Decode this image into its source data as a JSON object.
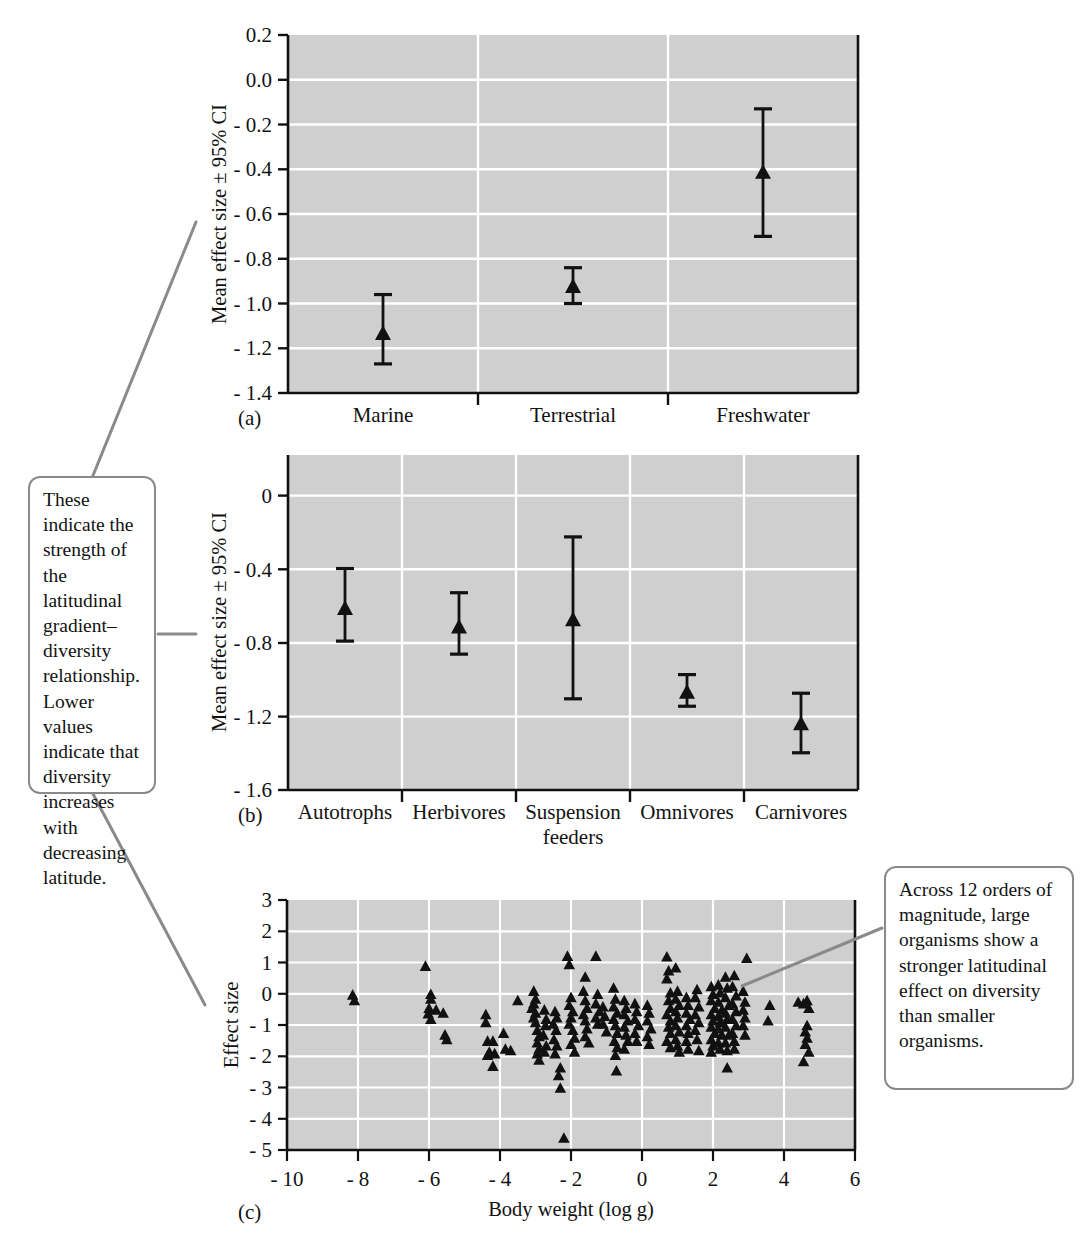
{
  "figure": {
    "panels": [
      {
        "id": "a",
        "letter": "(a)",
        "ylabel": "Mean effect size ± 95% CI",
        "xlabel": ""
      },
      {
        "id": "b",
        "letter": "(b)",
        "ylabel": "Mean effect size ± 95% CI",
        "xlabel": ""
      },
      {
        "id": "c",
        "letter": "(c)",
        "ylabel": "Effect size",
        "xlabel": "Body weight (log g)"
      }
    ],
    "annotations": [
      {
        "id": "callout-left",
        "text": "These indicate the strength of the latitudinal gradient–diversity relationship. Lower values indicate that diversity increases with decreasing latitude.",
        "lines": [
          "These",
          "indicate the",
          "strength of",
          "the latitudinal",
          "gradient–",
          "diversity",
          "relationship.",
          "Lower values",
          "indicate that",
          "diversity",
          "increases with",
          "decreasing",
          "latitude."
        ],
        "points_to": [
          "panel-a",
          "panel-b",
          "panel-c"
        ]
      },
      {
        "id": "callout-right",
        "text": "Across 12 orders of magnitude, large organisms show a stronger latitudinal effect on diversity than smaller organisms.",
        "lines": [
          "Across 12 orders",
          "of magnitude,",
          "large organisms",
          "show a stronger",
          "latitudinal effect",
          "on diversity",
          "than smaller",
          "organisms."
        ],
        "points_to": [
          "panel-c"
        ]
      }
    ],
    "colors": {
      "plot_background": "#cfcfcf",
      "gridline": "#ffffff",
      "marker": "#111111",
      "axis": "#111111",
      "callout_border": "#8a8a8a",
      "leader_line": "#8a8a8a",
      "page_background": "#ffffff"
    }
  },
  "chart_data": [
    {
      "type": "scatter",
      "id": "panel-a",
      "title": "",
      "xlabel": "",
      "ylabel": "Mean effect size ± 95% CI",
      "ylim": [
        -1.4,
        0.2
      ],
      "yticks": [
        "0.2",
        "0.0",
        "- 0.2",
        "- 0.4",
        "- 0.6",
        "- 0.8",
        "- 1.0",
        "- 1.2",
        "- 1.4"
      ],
      "ytick_values": [
        0.2,
        0.0,
        -0.2,
        -0.4,
        -0.6,
        -0.8,
        -1.0,
        -1.2,
        -1.4
      ],
      "grid": true,
      "legend": "none",
      "categories": [
        "Marine",
        "Terrestrial",
        "Freshwater"
      ],
      "values": [
        -1.13,
        -0.92,
        -0.41
      ],
      "ci_low": [
        -1.27,
        -1.0,
        -0.7
      ],
      "ci_high": [
        -0.96,
        -0.84,
        -0.13
      ],
      "marker": "triangle"
    },
    {
      "type": "scatter",
      "id": "panel-b",
      "title": "",
      "xlabel": "",
      "ylabel": "Mean effect size ± 95% CI",
      "ylim": [
        -1.6,
        0.2
      ],
      "yticks": [
        "0",
        "- 0.4",
        "- 0.8",
        "- 1.2",
        "- 1.6"
      ],
      "ytick_values": [
        0.0,
        -0.4,
        -0.8,
        -1.2,
        -1.6
      ],
      "grid": true,
      "legend": "none",
      "categories": [
        "Autotrophs",
        "Herbivores",
        "Suspension feeders",
        "Omnivores",
        "Carnivores"
      ],
      "category_lines": [
        [
          "Autotrophs"
        ],
        [
          "Herbivores"
        ],
        [
          "Suspension",
          "feeders"
        ],
        [
          "Omnivores"
        ],
        [
          "Carnivores"
        ]
      ],
      "values": [
        -0.62,
        -0.72,
        -0.68,
        -1.07,
        -1.24
      ],
      "ci_low": [
        -0.8,
        -0.87,
        -1.11,
        -1.15,
        -1.4
      ],
      "ci_high": [
        -0.41,
        -0.54,
        -0.24,
        -0.98,
        -1.08
      ],
      "marker": "triangle"
    },
    {
      "type": "scatter",
      "id": "panel-c",
      "title": "",
      "xlabel": "Body weight (log g)",
      "ylabel": "Effect size",
      "xlim": [
        -10,
        6
      ],
      "ylim": [
        -5,
        3
      ],
      "xticks": [
        "- 10",
        "- 8",
        "- 6",
        "- 4",
        "- 2",
        "0",
        "2",
        "4",
        "6"
      ],
      "xtick_values": [
        -10,
        -8,
        -6,
        -4,
        -2,
        0,
        2,
        4,
        6
      ],
      "yticks": [
        "3",
        "2",
        "1",
        "0",
        "- 1",
        "- 2",
        "- 3",
        "- 4",
        "- 5"
      ],
      "ytick_values": [
        3,
        2,
        1,
        0,
        -1,
        -2,
        -3,
        -4,
        -5
      ],
      "grid": true,
      "legend": "none",
      "marker": "triangle",
      "points": [
        [
          -8.15,
          -0.02
        ],
        [
          -8.1,
          -0.2
        ],
        [
          -6.1,
          0.9
        ],
        [
          -5.95,
          0.0
        ],
        [
          -5.95,
          -0.15
        ],
        [
          -6.0,
          -0.45
        ],
        [
          -5.8,
          -0.5
        ],
        [
          -6.02,
          -0.62
        ],
        [
          -5.95,
          -0.8
        ],
        [
          -5.6,
          -0.6
        ],
        [
          -5.55,
          -1.3
        ],
        [
          -5.5,
          -1.45
        ],
        [
          -4.4,
          -0.65
        ],
        [
          -4.4,
          -0.9
        ],
        [
          -4.35,
          -1.5
        ],
        [
          -4.2,
          -1.5
        ],
        [
          -4.3,
          -1.85
        ],
        [
          -4.15,
          -1.9
        ],
        [
          -4.35,
          -1.95
        ],
        [
          -4.2,
          -2.3
        ],
        [
          -3.9,
          -1.25
        ],
        [
          -3.85,
          -1.75
        ],
        [
          -3.7,
          -1.8
        ],
        [
          -3.5,
          -0.2
        ],
        [
          -3.05,
          0.1
        ],
        [
          -3.0,
          -0.15
        ],
        [
          -3.05,
          -0.3
        ],
        [
          -3.1,
          -0.45
        ],
        [
          -3.0,
          -0.6
        ],
        [
          -3.05,
          -0.75
        ],
        [
          -3.0,
          -0.9
        ],
        [
          -2.95,
          -1.15
        ],
        [
          -2.9,
          -1.35
        ],
        [
          -2.95,
          -1.55
        ],
        [
          -2.9,
          -1.75
        ],
        [
          -2.95,
          -1.9
        ],
        [
          -2.9,
          -2.1
        ],
        [
          -2.75,
          -0.5
        ],
        [
          -2.7,
          -0.8
        ],
        [
          -2.72,
          -1.0
        ],
        [
          -2.78,
          -1.3
        ],
        [
          -2.7,
          -1.65
        ],
        [
          -2.75,
          -1.85
        ],
        [
          -2.45,
          -0.55
        ],
        [
          -2.4,
          -0.75
        ],
        [
          -2.5,
          -0.95
        ],
        [
          -2.42,
          -1.15
        ],
        [
          -2.48,
          -1.45
        ],
        [
          -2.4,
          -1.65
        ],
        [
          -2.45,
          -1.9
        ],
        [
          -2.3,
          -2.35
        ],
        [
          -2.35,
          -2.6
        ],
        [
          -2.3,
          -3.0
        ],
        [
          -2.2,
          -4.6
        ],
        [
          -2.1,
          1.22
        ],
        [
          -2.05,
          0.95
        ],
        [
          -2.0,
          -0.1
        ],
        [
          -2.05,
          -0.35
        ],
        [
          -1.95,
          -0.55
        ],
        [
          -2.0,
          -0.75
        ],
        [
          -2.05,
          -0.95
        ],
        [
          -1.95,
          -1.15
        ],
        [
          -1.9,
          -1.4
        ],
        [
          -2.0,
          -1.6
        ],
        [
          -1.9,
          -1.85
        ],
        [
          -1.6,
          0.55
        ],
        [
          -1.65,
          0.1
        ],
        [
          -1.6,
          -0.2
        ],
        [
          -1.55,
          -0.45
        ],
        [
          -1.65,
          -0.65
        ],
        [
          -1.6,
          -0.85
        ],
        [
          -1.55,
          -1.1
        ],
        [
          -1.6,
          -1.35
        ],
        [
          -1.5,
          -1.55
        ],
        [
          -1.3,
          1.22
        ],
        [
          -1.25,
          0.0
        ],
        [
          -1.3,
          -0.3
        ],
        [
          -1.2,
          -0.55
        ],
        [
          -1.3,
          -0.75
        ],
        [
          -1.25,
          -0.95
        ],
        [
          -1.1,
          -0.4
        ],
        [
          -1.05,
          -0.7
        ],
        [
          -1.1,
          -0.95
        ],
        [
          -1.0,
          -1.2
        ],
        [
          -0.8,
          0.2
        ],
        [
          -0.75,
          -0.15
        ],
        [
          -0.8,
          -0.4
        ],
        [
          -0.7,
          -0.6
        ],
        [
          -0.8,
          -0.8
        ],
        [
          -0.75,
          -1.0
        ],
        [
          -0.7,
          -1.25
        ],
        [
          -0.78,
          -1.5
        ],
        [
          -0.7,
          -1.7
        ],
        [
          -0.75,
          -1.95
        ],
        [
          -0.72,
          -2.45
        ],
        [
          -0.5,
          -0.2
        ],
        [
          -0.45,
          -0.45
        ],
        [
          -0.5,
          -0.65
        ],
        [
          -0.4,
          -0.85
        ],
        [
          -0.5,
          -1.05
        ],
        [
          -0.45,
          -1.3
        ],
        [
          -0.4,
          -1.5
        ],
        [
          -0.5,
          -1.75
        ],
        [
          -0.2,
          -0.3
        ],
        [
          -0.15,
          -0.55
        ],
        [
          -0.2,
          -0.8
        ],
        [
          -0.1,
          -1.0
        ],
        [
          -0.2,
          -1.25
        ],
        [
          -0.15,
          -1.5
        ],
        [
          0.15,
          -0.35
        ],
        [
          0.2,
          -0.6
        ],
        [
          0.15,
          -0.85
        ],
        [
          0.25,
          -1.1
        ],
        [
          0.15,
          -1.35
        ],
        [
          0.2,
          -1.6
        ],
        [
          0.7,
          1.2
        ],
        [
          0.75,
          0.75
        ],
        [
          0.7,
          0.5
        ],
        [
          0.8,
          0.05
        ],
        [
          0.75,
          -0.2
        ],
        [
          0.8,
          -0.45
        ],
        [
          0.7,
          -0.65
        ],
        [
          0.8,
          -0.85
        ],
        [
          0.75,
          -1.05
        ],
        [
          0.8,
          -1.25
        ],
        [
          0.7,
          -1.5
        ],
        [
          0.8,
          -1.7
        ],
        [
          0.95,
          0.85
        ],
        [
          1.0,
          0.1
        ],
        [
          0.95,
          -0.15
        ],
        [
          1.05,
          -0.35
        ],
        [
          0.95,
          -0.55
        ],
        [
          1.0,
          -0.75
        ],
        [
          0.95,
          -1.0
        ],
        [
          1.05,
          -1.2
        ],
        [
          0.95,
          -1.45
        ],
        [
          1.0,
          -1.65
        ],
        [
          1.05,
          -1.85
        ],
        [
          1.25,
          -0.1
        ],
        [
          1.3,
          -0.35
        ],
        [
          1.25,
          -0.6
        ],
        [
          1.35,
          -0.8
        ],
        [
          1.25,
          -1.0
        ],
        [
          1.3,
          -1.25
        ],
        [
          1.25,
          -1.5
        ],
        [
          1.3,
          -1.75
        ],
        [
          1.55,
          0.15
        ],
        [
          1.5,
          -0.1
        ],
        [
          1.6,
          -0.4
        ],
        [
          1.5,
          -0.65
        ],
        [
          1.6,
          -0.9
        ],
        [
          1.5,
          -1.15
        ],
        [
          1.55,
          -1.45
        ],
        [
          1.6,
          -1.8
        ],
        [
          1.95,
          0.25
        ],
        [
          2.0,
          0.0
        ],
        [
          1.95,
          -0.2
        ],
        [
          2.05,
          -0.45
        ],
        [
          1.95,
          -0.65
        ],
        [
          2.0,
          -0.85
        ],
        [
          1.95,
          -1.05
        ],
        [
          2.05,
          -1.25
        ],
        [
          1.95,
          -1.45
        ],
        [
          2.0,
          -1.65
        ],
        [
          1.95,
          -1.85
        ],
        [
          2.15,
          0.3
        ],
        [
          2.2,
          0.05
        ],
        [
          2.15,
          -0.25
        ],
        [
          2.25,
          -0.5
        ],
        [
          2.15,
          -0.7
        ],
        [
          2.2,
          -0.9
        ],
        [
          2.15,
          -1.1
        ],
        [
          2.25,
          -1.3
        ],
        [
          2.15,
          -1.55
        ],
        [
          2.2,
          -1.75
        ],
        [
          2.35,
          0.55
        ],
        [
          2.4,
          0.2
        ],
        [
          2.35,
          -0.1
        ],
        [
          2.45,
          -0.35
        ],
        [
          2.35,
          -0.6
        ],
        [
          2.4,
          -0.8
        ],
        [
          2.35,
          -1.05
        ],
        [
          2.45,
          -1.3
        ],
        [
          2.35,
          -1.55
        ],
        [
          2.4,
          -1.8
        ],
        [
          2.4,
          -2.35
        ],
        [
          2.6,
          0.6
        ],
        [
          2.55,
          0.25
        ],
        [
          2.65,
          -0.05
        ],
        [
          2.55,
          -0.3
        ],
        [
          2.65,
          -0.55
        ],
        [
          2.55,
          -0.8
        ],
        [
          2.65,
          -1.0
        ],
        [
          2.55,
          -1.25
        ],
        [
          2.6,
          -1.5
        ],
        [
          2.6,
          -1.75
        ],
        [
          2.85,
          0.1
        ],
        [
          2.9,
          -0.25
        ],
        [
          2.85,
          -0.5
        ],
        [
          2.9,
          -0.75
        ],
        [
          2.85,
          -1.0
        ],
        [
          2.9,
          -1.3
        ],
        [
          2.95,
          1.15
        ],
        [
          3.6,
          -0.35
        ],
        [
          3.55,
          -0.85
        ],
        [
          4.4,
          -0.25
        ],
        [
          4.55,
          -0.3
        ],
        [
          4.65,
          -0.2
        ],
        [
          4.7,
          -0.45
        ],
        [
          4.65,
          -1.0
        ],
        [
          4.6,
          -1.2
        ],
        [
          4.65,
          -1.4
        ],
        [
          4.6,
          -1.6
        ],
        [
          4.7,
          -1.85
        ],
        [
          4.55,
          -2.15
        ]
      ]
    }
  ]
}
